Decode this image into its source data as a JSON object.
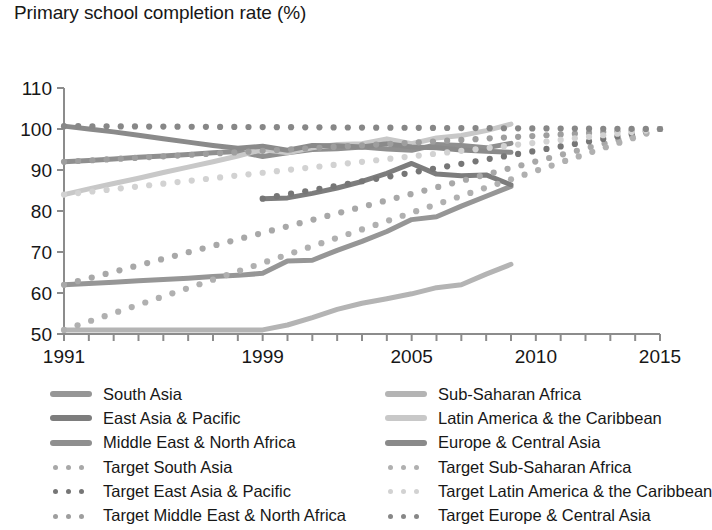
{
  "chart_data": {
    "type": "line",
    "title": "Primary school completion rate (%)",
    "xlabel": "",
    "ylabel": "",
    "xlim": [
      1991,
      2015
    ],
    "ylim": [
      50,
      110
    ],
    "yticks": [
      50,
      60,
      70,
      80,
      90,
      100,
      110
    ],
    "ytick_labels": [
      "50",
      "60",
      "70",
      "80",
      "90",
      "100",
      "110"
    ],
    "xticks": [
      1991,
      1992,
      1993,
      1994,
      1995,
      1996,
      1997,
      1998,
      1999,
      2000,
      2001,
      2002,
      2003,
      2004,
      2005,
      2006,
      2007,
      2008,
      2009,
      2010,
      2011,
      2012,
      2013,
      2014,
      2015
    ],
    "xtick_labels": [
      "1991",
      "1999",
      "2005",
      "2010",
      "2015"
    ],
    "xtick_label_values": [
      1991,
      1999,
      2005,
      2010,
      2015
    ],
    "grid": false,
    "legend_position": "below",
    "series": [
      {
        "name": "South Asia",
        "style": "solid",
        "color": "#969696",
        "x": [
          1991,
          1992,
          1993,
          1994,
          1995,
          1996,
          1997,
          1998,
          1999,
          2000,
          2001,
          2002,
          2003,
          2004,
          2005,
          2006,
          2007,
          2008,
          2009
        ],
        "values": [
          62.0,
          62.3,
          62.6,
          63.0,
          63.3,
          63.6,
          64.0,
          64.3,
          64.8,
          67.8,
          68.0,
          70.4,
          72.6,
          75.0,
          77.9,
          78.6,
          81.2,
          83.6,
          86.0
        ]
      },
      {
        "name": "East Asia & Pacific",
        "style": "solid",
        "color": "#7d7d7d",
        "x": [
          1999,
          2000,
          2001,
          2002,
          2003,
          2004,
          2005,
          2006,
          2007,
          2008,
          2009
        ],
        "values": [
          83.0,
          83.2,
          84.3,
          85.6,
          87.2,
          89.2,
          91.6,
          89.0,
          88.6,
          88.8,
          86.4
        ]
      },
      {
        "name": "Middle East & North Africa",
        "style": "solid",
        "color": "#8f8f8f",
        "x": [
          1991,
          1992,
          1993,
          1994,
          1995,
          1996,
          1997,
          1998,
          1999,
          2000,
          2001,
          2002,
          2003,
          2004,
          2005,
          2006,
          2007,
          2008,
          2009
        ],
        "values": [
          92.0,
          92.3,
          92.7,
          93.1,
          93.4,
          93.8,
          94.2,
          94.5,
          93.3,
          94.2,
          95.0,
          95.2,
          95.6,
          95.1,
          94.8,
          96.2,
          96.0,
          95.4,
          96.5
        ]
      },
      {
        "name": "Sub-Saharan Africa",
        "style": "solid",
        "color": "#b4b4b4",
        "x": [
          1991,
          1992,
          1993,
          1994,
          1995,
          1996,
          1997,
          1998,
          1999,
          2000,
          2001,
          2002,
          2003,
          2004,
          2005,
          2006,
          2007,
          2008,
          2009
        ],
        "values": [
          51.0,
          51.0,
          51.0,
          51.0,
          51.0,
          51.0,
          51.0,
          51.0,
          51.0,
          52.2,
          54.0,
          56.0,
          57.5,
          58.6,
          59.8,
          61.3,
          62.0,
          64.6,
          67.0
        ]
      },
      {
        "name": "Latin America & the Caribbean",
        "style": "solid",
        "color": "#c8c8c8",
        "x": [
          1991,
          1992,
          1993,
          1994,
          1995,
          1996,
          1997,
          1998,
          1999,
          2000,
          2001,
          2002,
          2003,
          2004,
          2005,
          2006,
          2007,
          2008,
          2009
        ],
        "values": [
          84.0,
          85.4,
          86.7,
          88.0,
          89.4,
          90.7,
          92.0,
          93.4,
          95.0,
          94.2,
          95.4,
          96.2,
          96.4,
          97.6,
          96.4,
          97.8,
          98.4,
          99.6,
          101.2
        ]
      },
      {
        "name": "Europe & Central Asia",
        "style": "solid",
        "color": "#8a8a8a",
        "x": [
          1991,
          1992,
          1993,
          1994,
          1995,
          1996,
          1997,
          1998,
          1999,
          2000,
          2001,
          2002,
          2003,
          2004,
          2005,
          2006,
          2007,
          2008,
          2009
        ],
        "values": [
          100.7,
          100.0,
          99.3,
          98.5,
          97.6,
          96.8,
          96.0,
          95.3,
          95.8,
          94.8,
          96.0,
          95.9,
          95.6,
          96.4,
          95.6,
          95.4,
          94.9,
          94.6,
          94.3
        ]
      },
      {
        "name": "Target South Asia",
        "style": "dotted",
        "color": "#a8a8a8",
        "x": [
          1991,
          2015
        ],
        "values": [
          62.0,
          100.0
        ]
      },
      {
        "name": "Target East Asia & Pacific",
        "style": "dotted",
        "color": "#767676",
        "x": [
          1999,
          2015
        ],
        "values": [
          83.0,
          100.0
        ]
      },
      {
        "name": "Target Middle East & North Africa",
        "style": "dotted",
        "color": "#9e9e9e",
        "x": [
          1991,
          2015
        ],
        "values": [
          92.0,
          100.0
        ]
      },
      {
        "name": "Target Sub-Saharan Africa",
        "style": "dotted",
        "color": "#b0b0b0",
        "x": [
          1991,
          2015
        ],
        "values": [
          51.0,
          100.0
        ]
      },
      {
        "name": "Target Latin America & the Caribbean",
        "style": "dotted",
        "color": "#d2d2d2",
        "x": [
          1991,
          2015
        ],
        "values": [
          84.0,
          100.0
        ]
      },
      {
        "name": "Target Europe & Central Asia",
        "style": "dotted",
        "color": "#878787",
        "x": [
          1991,
          2015
        ],
        "values": [
          100.7,
          100.0
        ]
      }
    ]
  },
  "legend": {
    "left_column": [
      {
        "label": "South Asia",
        "color": "#969696",
        "style": "solid"
      },
      {
        "label": "East Asia & Pacific",
        "color": "#7d7d7d",
        "style": "solid"
      },
      {
        "label": "Middle East & North Africa",
        "color": "#8f8f8f",
        "style": "solid"
      },
      {
        "label": "Target South Asia",
        "color": "#a8a8a8",
        "style": "dotted"
      },
      {
        "label": "Target East Asia & Pacific",
        "color": "#767676",
        "style": "dotted"
      },
      {
        "label": "Target Middle East & North Africa",
        "color": "#9e9e9e",
        "style": "dotted"
      }
    ],
    "right_column": [
      {
        "label": "Sub-Saharan Africa",
        "color": "#b4b4b4",
        "style": "solid"
      },
      {
        "label": "Latin America & the Caribbean",
        "color": "#c8c8c8",
        "style": "solid"
      },
      {
        "label": "Europe & Central Asia",
        "color": "#8a8a8a",
        "style": "solid"
      },
      {
        "label": "Target Sub-Saharan Africa",
        "color": "#b0b0b0",
        "style": "dotted"
      },
      {
        "label": "Target Latin America & the Caribbean",
        "color": "#d2d2d2",
        "style": "dotted"
      },
      {
        "label": "Target Europe & Central Asia",
        "color": "#878787",
        "style": "dotted"
      }
    ]
  },
  "axis": {
    "color": "#8c8c8c"
  }
}
